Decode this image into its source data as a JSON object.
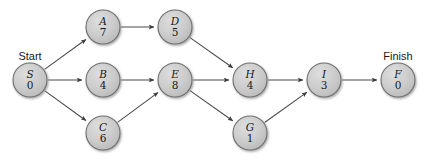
{
  "diagram": {
    "type": "activity-on-node-network",
    "title": "",
    "start_label": "Start",
    "finish_label": "Finish",
    "node_fill_color": "#c9c9c9",
    "node_stroke_color": "#6f6f6f",
    "edge_color": "#4a4a4a",
    "background_color": "#ffffff",
    "nodes": [
      {
        "id": "S",
        "letter": "S",
        "duration": "0",
        "cx": 30,
        "cy": 80,
        "r": 17,
        "terminal": "Start"
      },
      {
        "id": "A",
        "letter": "A",
        "duration": "7",
        "cx": 103,
        "cy": 27,
        "r": 17,
        "terminal": ""
      },
      {
        "id": "B",
        "letter": "B",
        "duration": "4",
        "cx": 103,
        "cy": 80,
        "r": 17,
        "terminal": ""
      },
      {
        "id": "C",
        "letter": "C",
        "duration": "6",
        "cx": 103,
        "cy": 133,
        "r": 17,
        "terminal": ""
      },
      {
        "id": "D",
        "letter": "D",
        "duration": "5",
        "cx": 175,
        "cy": 27,
        "r": 17,
        "terminal": ""
      },
      {
        "id": "E",
        "letter": "E",
        "duration": "8",
        "cx": 175,
        "cy": 80,
        "r": 17,
        "terminal": ""
      },
      {
        "id": "H",
        "letter": "H",
        "duration": "4",
        "cx": 250,
        "cy": 80,
        "r": 17,
        "terminal": ""
      },
      {
        "id": "G",
        "letter": "G",
        "duration": "1",
        "cx": 250,
        "cy": 133,
        "r": 17,
        "terminal": ""
      },
      {
        "id": "I",
        "letter": "I",
        "duration": "3",
        "cx": 324,
        "cy": 80,
        "r": 17,
        "terminal": ""
      },
      {
        "id": "F",
        "letter": "F",
        "duration": "0",
        "cx": 398,
        "cy": 80,
        "r": 17,
        "terminal": "Finish"
      }
    ],
    "edges": [
      {
        "from": "S",
        "to": "A"
      },
      {
        "from": "S",
        "to": "B"
      },
      {
        "from": "S",
        "to": "C"
      },
      {
        "from": "A",
        "to": "D"
      },
      {
        "from": "B",
        "to": "E"
      },
      {
        "from": "C",
        "to": "E"
      },
      {
        "from": "D",
        "to": "H"
      },
      {
        "from": "E",
        "to": "H"
      },
      {
        "from": "E",
        "to": "G"
      },
      {
        "from": "H",
        "to": "I"
      },
      {
        "from": "G",
        "to": "I"
      },
      {
        "from": "I",
        "to": "F"
      }
    ],
    "terminal_labels": [
      {
        "text": "Start",
        "x": 30,
        "y": 60
      },
      {
        "text": "Finish",
        "x": 398,
        "y": 60
      }
    ]
  }
}
